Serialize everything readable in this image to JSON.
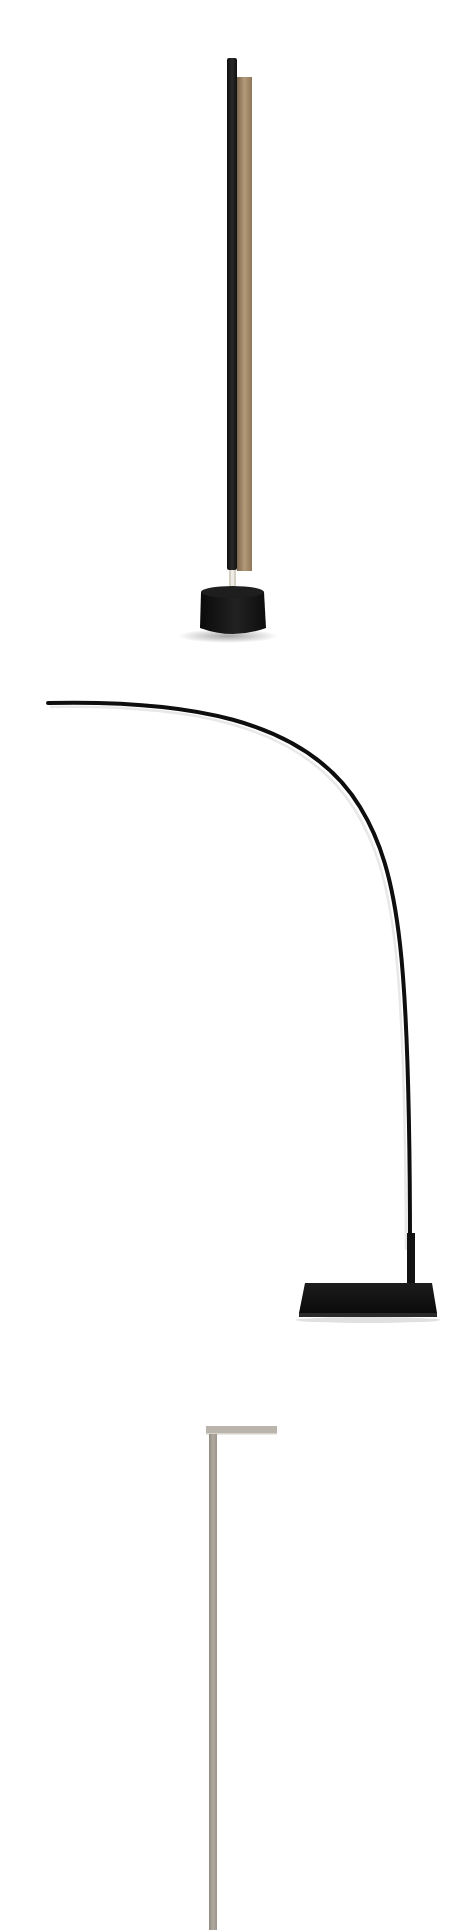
{
  "page": {
    "background": "#ffffff",
    "width": 473,
    "height": 1930
  },
  "photos": [
    {
      "subject": "floor-lamp-vertical-bar",
      "colors": {
        "pole": "#1c1c1c",
        "panel": "#a48a68",
        "base": "#141414",
        "collar": "#d8d2c4"
      }
    },
    {
      "subject": "floor-lamp-arc",
      "colors": {
        "arc": "#0e0e0e",
        "highlight": "#e9e9e9",
        "base": "#121212"
      }
    },
    {
      "subject": "floor-lamp-l-shape",
      "colors": {
        "pole": "#a7a198",
        "head": "#b9b4ab"
      }
    }
  ]
}
